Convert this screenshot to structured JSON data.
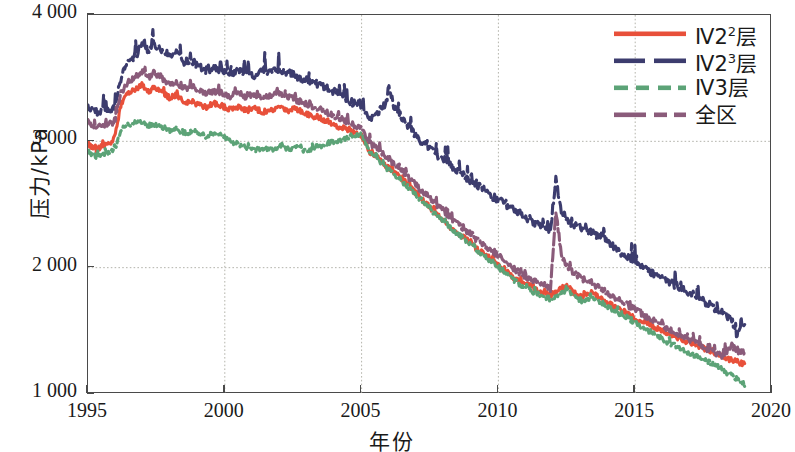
{
  "chart_data": {
    "type": "line",
    "title": "",
    "xlabel": "年份",
    "ylabel": "压力/kPa",
    "xlim": [
      1995,
      2020
    ],
    "ylim": [
      1000,
      4000
    ],
    "xticks": [
      "1995",
      "2000",
      "2005",
      "2010",
      "2015",
      "2020"
    ],
    "xtick_values": [
      1995,
      2000,
      2005,
      2010,
      2015,
      2020
    ],
    "yticks": [
      "1 000",
      "2 000",
      "3 000",
      "4 000"
    ],
    "ytick_values": [
      1000,
      2000,
      3000,
      4000
    ],
    "grid": true,
    "grid_style": "dotted-gray",
    "legend_position": "top-right",
    "series": [
      {
        "name": "Ⅳ2²层",
        "name_base": "Ⅳ2",
        "name_sup": "2",
        "name_tail": "层",
        "color": "#E8503A",
        "dash": "solid",
        "x": [
          1995.0,
          1995.3,
          1995.6,
          1995.9,
          1996.0,
          1996.2,
          1996.4,
          1996.6,
          1996.8,
          1997.0,
          1997.2,
          1997.4,
          1997.6,
          1997.8,
          1998.0,
          1998.2,
          1998.4,
          1998.6,
          1998.8,
          1999.0,
          1999.3,
          1999.6,
          1999.9,
          2000.2,
          2000.5,
          2000.8,
          2001.1,
          2001.4,
          2001.7,
          2002.0,
          2002.3,
          2002.6,
          2002.9,
          2003.2,
          2003.5,
          2003.8,
          2004.1,
          2004.4,
          2004.7,
          2005.0,
          2005.3,
          2005.6,
          2005.9,
          2006.2,
          2006.5,
          2006.8,
          2007.1,
          2007.4,
          2007.7,
          2008.0,
          2008.3,
          2008.6,
          2008.9,
          2009.2,
          2009.5,
          2009.8,
          2010.1,
          2010.4,
          2010.7,
          2011.0,
          2011.3,
          2011.6,
          2011.9,
          2012.2,
          2012.5,
          2012.8,
          2013.1,
          2013.4,
          2013.7,
          2014.0,
          2014.3,
          2014.6,
          2014.9,
          2015.2,
          2015.5,
          2015.8,
          2016.1,
          2016.4,
          2016.7,
          2017.0,
          2017.3,
          2017.6,
          2017.9,
          2018.2,
          2018.5,
          2018.8,
          2019.0
        ],
        "y": [
          2980,
          2930,
          2970,
          2990,
          3050,
          3280,
          3360,
          3400,
          3420,
          3450,
          3390,
          3430,
          3400,
          3380,
          3340,
          3360,
          3330,
          3300,
          3320,
          3290,
          3270,
          3300,
          3280,
          3250,
          3270,
          3240,
          3260,
          3230,
          3250,
          3270,
          3240,
          3260,
          3230,
          3200,
          3180,
          3160,
          3120,
          3100,
          3070,
          3050,
          2920,
          2880,
          2800,
          2760,
          2700,
          2640,
          2560,
          2500,
          2430,
          2380,
          2300,
          2260,
          2210,
          2150,
          2100,
          2060,
          2000,
          1950,
          1900,
          1870,
          1840,
          1800,
          1780,
          1820,
          1860,
          1790,
          1760,
          1800,
          1760,
          1720,
          1680,
          1650,
          1610,
          1580,
          1550,
          1520,
          1490,
          1460,
          1430,
          1400,
          1380,
          1350,
          1330,
          1300,
          1270,
          1250,
          1240
        ]
      },
      {
        "name": "Ⅳ2³层",
        "name_base": "Ⅳ2",
        "name_sup": "3",
        "name_tail": "层",
        "color": "#3C3C6E",
        "dash": "dashed-long",
        "x": [
          1995.0,
          1995.3,
          1995.6,
          1995.9,
          1996.0,
          1996.2,
          1996.4,
          1996.6,
          1996.8,
          1997.0,
          1997.2,
          1997.4,
          1997.6,
          1997.8,
          1998.0,
          1998.2,
          1998.4,
          1998.6,
          1998.8,
          1999.0,
          1999.3,
          1999.6,
          1999.9,
          2000.2,
          2000.5,
          2000.8,
          2001.1,
          2001.4,
          2001.7,
          2002.0,
          2002.3,
          2002.6,
          2002.9,
          2003.2,
          2003.5,
          2003.8,
          2004.1,
          2004.4,
          2004.7,
          2005.0,
          2005.3,
          2005.6,
          2005.9,
          2006.0,
          2006.2,
          2006.5,
          2006.8,
          2007.1,
          2007.4,
          2007.7,
          2008.0,
          2008.3,
          2008.6,
          2008.9,
          2009.2,
          2009.5,
          2009.8,
          2010.1,
          2010.4,
          2010.7,
          2011.0,
          2011.3,
          2011.6,
          2011.9,
          2012.1,
          2012.3,
          2012.5,
          2012.8,
          2013.1,
          2013.4,
          2013.7,
          2014.0,
          2014.3,
          2014.6,
          2014.9,
          2015.2,
          2015.5,
          2015.8,
          2016.1,
          2016.4,
          2016.7,
          2017.0,
          2017.3,
          2017.6,
          2017.9,
          2018.2,
          2018.5,
          2018.7,
          2018.9,
          2019.0
        ],
        "y": [
          3280,
          3230,
          3250,
          3240,
          3300,
          3500,
          3600,
          3650,
          3700,
          3800,
          3720,
          3780,
          3740,
          3700,
          3680,
          3700,
          3650,
          3620,
          3640,
          3600,
          3560,
          3580,
          3550,
          3530,
          3560,
          3540,
          3520,
          3560,
          3540,
          3570,
          3550,
          3520,
          3490,
          3470,
          3440,
          3410,
          3380,
          3340,
          3300,
          3270,
          3180,
          3230,
          3300,
          3450,
          3260,
          3180,
          3100,
          3020,
          2960,
          2900,
          2850,
          2800,
          2760,
          2700,
          2660,
          2620,
          2560,
          2520,
          2480,
          2440,
          2400,
          2360,
          2330,
          2300,
          2700,
          2450,
          2380,
          2330,
          2300,
          2280,
          2240,
          2200,
          2150,
          2100,
          2060,
          2020,
          1980,
          1940,
          1900,
          1870,
          1830,
          1800,
          1760,
          1720,
          1680,
          1640,
          1600,
          1480,
          1540,
          1550
        ]
      },
      {
        "name": "Ⅳ3层",
        "name_base": "Ⅳ3",
        "name_sup": "",
        "name_tail": "层",
        "color": "#5CA377",
        "dash": "dashed-short",
        "x": [
          1995.0,
          1995.3,
          1995.6,
          1995.9,
          1996.0,
          1996.2,
          1996.4,
          1996.6,
          1996.8,
          1997.0,
          1997.2,
          1997.4,
          1997.6,
          1997.8,
          1998.0,
          1998.2,
          1998.4,
          1998.6,
          1998.8,
          1999.0,
          1999.3,
          1999.6,
          1999.9,
          2000.2,
          2000.5,
          2000.8,
          2001.1,
          2001.4,
          2001.7,
          2002.0,
          2002.3,
          2002.6,
          2002.9,
          2003.2,
          2003.5,
          2003.8,
          2004.1,
          2004.4,
          2004.7,
          2005.0,
          2005.3,
          2005.6,
          2005.9,
          2006.2,
          2006.5,
          2006.8,
          2007.1,
          2007.4,
          2007.7,
          2008.0,
          2008.3,
          2008.6,
          2008.9,
          2009.2,
          2009.5,
          2009.8,
          2010.1,
          2010.4,
          2010.7,
          2011.0,
          2011.3,
          2011.6,
          2011.9,
          2012.2,
          2012.5,
          2012.8,
          2013.1,
          2013.4,
          2013.7,
          2014.0,
          2014.3,
          2014.6,
          2014.9,
          2015.2,
          2015.5,
          2015.8,
          2016.1,
          2016.4,
          2016.7,
          2017.0,
          2017.3,
          2017.6,
          2017.9,
          2018.2,
          2018.5,
          2018.8,
          2019.0
        ],
        "y": [
          2920,
          2880,
          2900,
          2910,
          2950,
          3080,
          3120,
          3140,
          3150,
          3160,
          3120,
          3140,
          3120,
          3100,
          3080,
          3100,
          3080,
          3060,
          3080,
          3070,
          3040,
          3060,
          3040,
          3000,
          2980,
          2950,
          2930,
          2950,
          2930,
          2960,
          2940,
          2950,
          2930,
          2940,
          2960,
          2980,
          3000,
          3020,
          3050,
          3060,
          2900,
          2860,
          2790,
          2740,
          2680,
          2620,
          2550,
          2490,
          2420,
          2370,
          2300,
          2250,
          2200,
          2140,
          2090,
          2040,
          1980,
          1930,
          1880,
          1840,
          1800,
          1780,
          1750,
          1790,
          1830,
          1760,
          1730,
          1770,
          1730,
          1690,
          1650,
          1620,
          1580,
          1540,
          1500,
          1460,
          1420,
          1390,
          1350,
          1320,
          1290,
          1260,
          1230,
          1190,
          1150,
          1100,
          1060
        ]
      },
      {
        "name": "全区",
        "name_base": "全区",
        "name_sup": "",
        "name_tail": "",
        "color": "#8A5B7A",
        "dash": "dash-dot",
        "x": [
          1995.0,
          1995.3,
          1995.6,
          1995.9,
          1996.0,
          1996.2,
          1996.4,
          1996.6,
          1996.8,
          1997.0,
          1997.2,
          1997.4,
          1997.6,
          1997.8,
          1998.0,
          1998.2,
          1998.4,
          1998.6,
          1998.8,
          1999.0,
          1999.3,
          1999.6,
          1999.9,
          2000.2,
          2000.5,
          2000.8,
          2001.1,
          2001.4,
          2001.7,
          2002.0,
          2002.3,
          2002.6,
          2002.9,
          2003.2,
          2003.5,
          2003.8,
          2004.1,
          2004.4,
          2004.7,
          2005.0,
          2005.3,
          2005.6,
          2005.9,
          2006.2,
          2006.5,
          2006.8,
          2007.1,
          2007.4,
          2007.7,
          2008.0,
          2008.3,
          2008.6,
          2008.9,
          2009.2,
          2009.5,
          2009.8,
          2010.1,
          2010.4,
          2010.7,
          2011.0,
          2011.3,
          2011.6,
          2011.9,
          2012.1,
          2012.3,
          2012.5,
          2012.8,
          2013.1,
          2013.4,
          2013.7,
          2014.0,
          2014.3,
          2014.6,
          2014.9,
          2015.2,
          2015.5,
          2015.8,
          2016.1,
          2016.4,
          2016.7,
          2017.0,
          2017.3,
          2017.6,
          2017.9,
          2018.2,
          2018.5,
          2018.8,
          2019.0
        ],
        "y": [
          3150,
          3100,
          3130,
          3140,
          3180,
          3380,
          3450,
          3490,
          3520,
          3560,
          3500,
          3540,
          3510,
          3480,
          3450,
          3470,
          3440,
          3420,
          3440,
          3410,
          3380,
          3400,
          3380,
          3360,
          3380,
          3350,
          3370,
          3340,
          3360,
          3380,
          3350,
          3330,
          3300,
          3280,
          3250,
          3220,
          3190,
          3160,
          3130,
          3100,
          2980,
          2940,
          2870,
          2820,
          2760,
          2700,
          2630,
          2570,
          2500,
          2450,
          2380,
          2330,
          2280,
          2220,
          2170,
          2130,
          2070,
          2020,
          1970,
          1930,
          1900,
          1860,
          1830,
          2450,
          2100,
          2010,
          1950,
          1910,
          1880,
          1840,
          1800,
          1760,
          1720,
          1680,
          1640,
          1600,
          1570,
          1530,
          1490,
          1460,
          1430,
          1400,
          1360,
          1330,
          1300,
          1380,
          1330,
          1340
        ]
      }
    ]
  }
}
